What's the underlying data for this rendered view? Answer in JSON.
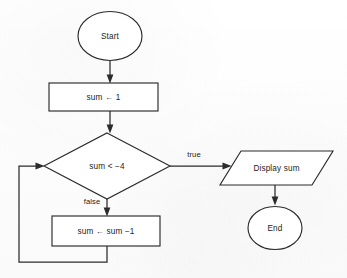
{
  "diagram": {
    "type": "flowchart",
    "nodes": {
      "start": {
        "label": "Start",
        "shape": "ellipse"
      },
      "init": {
        "label": "sum ← 1",
        "shape": "process"
      },
      "decision": {
        "label": "sum < −4",
        "shape": "decision"
      },
      "decrement": {
        "label": "sum ← sum −1",
        "shape": "process"
      },
      "display": {
        "label": "Display sum",
        "shape": "parallelogram"
      },
      "end": {
        "label": "End",
        "shape": "ellipse"
      }
    },
    "edges": {
      "true_branch": {
        "label": "true",
        "from": "decision",
        "to": "display"
      },
      "false_branch": {
        "label": "false",
        "from": "decision",
        "to": "decrement"
      },
      "loop_back": {
        "label": "",
        "from": "decrement",
        "to": "decision"
      },
      "start_to_init": {
        "label": "",
        "from": "start",
        "to": "init"
      },
      "init_to_decision": {
        "label": "",
        "from": "init",
        "to": "decision"
      },
      "display_to_end": {
        "label": "",
        "from": "display",
        "to": "end"
      }
    },
    "colors": {
      "stroke": "#2b2b2b",
      "fill": "#ffffff",
      "text": "#1c1c1c",
      "background": "#fdfdfd"
    }
  }
}
